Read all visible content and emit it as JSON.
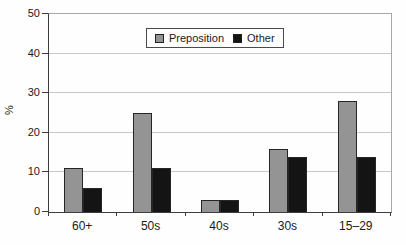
{
  "chart_data": {
    "type": "bar",
    "categories": [
      "60+",
      "50s",
      "40s",
      "30s",
      "15–29"
    ],
    "series": [
      {
        "name": "Preposition",
        "color": "#949494",
        "values": [
          11,
          25,
          3,
          16,
          28
        ]
      },
      {
        "name": "Other",
        "color": "#141414",
        "values": [
          6,
          11,
          3,
          14,
          14
        ]
      }
    ],
    "title": "",
    "xlabel": "",
    "ylabel": "%",
    "ylim": [
      0,
      50
    ],
    "yticks": [
      0,
      10,
      20,
      30,
      40,
      50
    ],
    "ytick_interval": 10,
    "grid": true,
    "legend_position": "top-center"
  },
  "colors": {
    "background": "#fefefe",
    "gridline": "#c9c9c9",
    "axis": "#3c3c3c",
    "plot_border": "#a8a8a8",
    "text": "#1a1a1a",
    "bar_preposition": "#949494",
    "bar_other": "#141414"
  }
}
